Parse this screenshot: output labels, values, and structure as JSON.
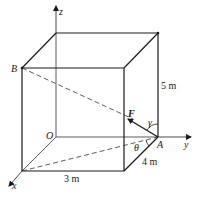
{
  "diagram": {
    "type": "3d-box-force",
    "axes": {
      "x": "x",
      "y": "y",
      "z": "z"
    },
    "points": {
      "origin": "O",
      "a": "A",
      "b": "B"
    },
    "force": {
      "label": "F"
    },
    "angles": {
      "gamma": "γ",
      "theta": "θ"
    },
    "dimensions": {
      "height": "5 m",
      "width": "3 m",
      "depth": "4 m"
    }
  }
}
